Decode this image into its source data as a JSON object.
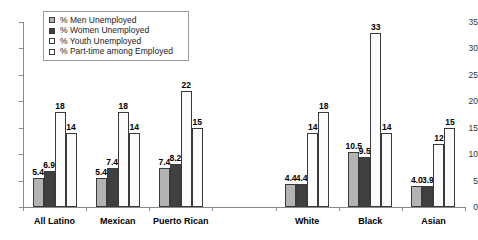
{
  "chart_data": {
    "type": "bar",
    "title": "",
    "subtitle": "",
    "xlabel": "",
    "ylabel": "",
    "ylim": [
      0,
      35
    ],
    "ytick_step": 5,
    "yticks": [
      "0",
      "5",
      "10",
      "15",
      "20",
      "25",
      "30",
      "35"
    ],
    "grid": false,
    "legend_position": "top-left",
    "categories": [
      "All Latino",
      "Mexican",
      "Puerto Rican",
      "",
      "White",
      "Black",
      "Asian"
    ],
    "series": [
      {
        "name": "% Men Unemployed",
        "color": "#b3b3b3",
        "values": [
          5.4,
          5.4,
          7.4,
          null,
          4.4,
          10.5,
          4.0
        ],
        "labels": [
          "5.4",
          "5.4",
          "7.4",
          "",
          "4.4",
          "10.5",
          "4.0"
        ]
      },
      {
        "name": "% Women Unemployed",
        "color": "#404040",
        "values": [
          6.9,
          7.4,
          8.2,
          null,
          4.4,
          9.5,
          3.9
        ],
        "labels": [
          "6.9",
          "7.4",
          "8.2",
          "",
          "4.4",
          "9.5",
          "3.9"
        ]
      },
      {
        "name": "% Youth Unemployed",
        "color": "#fbfbfb",
        "values": [
          18,
          18,
          22,
          null,
          14,
          33,
          12
        ],
        "labels": [
          "18",
          "18",
          "22",
          "",
          "14",
          "33",
          "12"
        ]
      },
      {
        "name": "% Part-time among Employed",
        "color": "#fbfbfb",
        "values": [
          14,
          14,
          15,
          null,
          18,
          14,
          15
        ],
        "labels": [
          "14",
          "14",
          "15",
          "",
          "18",
          "14",
          "15"
        ]
      }
    ]
  },
  "legend": {
    "items": [
      {
        "label": "% Men Unemployed"
      },
      {
        "label": "% Women Unemployed"
      },
      {
        "label": "% Youth Unemployed"
      },
      {
        "label": "% Part-time among Employed"
      }
    ]
  }
}
